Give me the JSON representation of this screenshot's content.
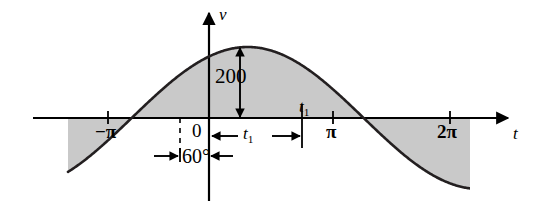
{
  "figure": {
    "background_color": "#ffffff",
    "curve_color": "#231f20",
    "shade_color": "#c9c9c9",
    "axis_color": "#000000"
  },
  "axes": {
    "vertical_axis_label": "v",
    "horizontal_axis_label": "t",
    "origin_label": "0"
  },
  "labels": {
    "amplitude": "200",
    "phase_angle": "60°",
    "t1_on_axis": "t",
    "t1_on_axis_sub": "1",
    "t1_span": "t",
    "t1_span_sub": "1",
    "tick_neg_pi": "−π",
    "tick_pi": "π",
    "tick_2pi": "2π"
  },
  "chart_data": {
    "type": "line",
    "xlabel": "t",
    "ylabel": "v",
    "amplitude": 200,
    "phase_shift_degrees": 60,
    "xlim": [
      -4.6,
      8.0
    ],
    "ylim": [
      -250,
      250
    ],
    "grid": false,
    "legend": false,
    "x_tick_labels": [
      "−π",
      "0",
      "π",
      "2π"
    ],
    "x_tick_values": [
      -3.14159,
      0,
      3.14159,
      6.28319
    ],
    "y_tick_labels": [],
    "annotations": [
      {
        "text": "200",
        "kind": "double-arrow-vertical",
        "from_y": 0,
        "to_y": 200,
        "at_x": 0.52
      },
      {
        "text": "t1",
        "kind": "double-arrow-horizontal",
        "from_x": 0,
        "to_x": 2.09,
        "at_y": -60
      },
      {
        "text": "60°",
        "kind": "double-arrow-horizontal",
        "from_x": -1.047,
        "to_x": 0,
        "at_y": -135
      },
      {
        "text": "t1",
        "kind": "point-label",
        "at_x": 2.09,
        "at_y": 0
      }
    ],
    "zero_crossings": [
      -1.047,
      2.094,
      5.236
    ],
    "peaks": [
      {
        "x": 0.524,
        "y": 200
      },
      {
        "x": 6.81,
        "y": 200
      }
    ],
    "troughs": [
      {
        "x": -2.618,
        "y": -200
      },
      {
        "x": 3.665,
        "y": -200
      }
    ],
    "shaded_region": "area between curve and t-axis"
  }
}
